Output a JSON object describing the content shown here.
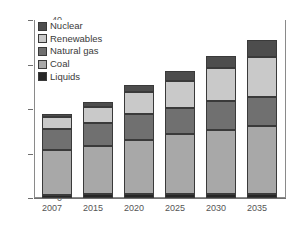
{
  "chart_data": {
    "type": "bar",
    "stacked": true,
    "title": "",
    "subtitle": "",
    "xlabel": "",
    "ylabel": "",
    "categories": [
      "2007",
      "2015",
      "2020",
      "2025",
      "2030",
      "2035"
    ],
    "series": [
      {
        "name": "Liquids",
        "color": "#262626",
        "values": [
          0.7,
          0.8,
          0.8,
          0.9,
          0.9,
          1.0
        ]
      },
      {
        "name": "Coal",
        "color": "#a8a8a8",
        "values": [
          10.2,
          11.0,
          12.2,
          13.4,
          14.4,
          15.1
        ]
      },
      {
        "name": "Natural gas",
        "color": "#707070",
        "values": [
          4.5,
          5.0,
          5.8,
          6.0,
          6.4,
          6.6
        ]
      },
      {
        "name": "Renewables",
        "color": "#c9c9c9",
        "values": [
          2.9,
          3.6,
          5.0,
          6.1,
          7.5,
          9.0
        ]
      },
      {
        "name": "Nuclear",
        "color": "#4d4d4d",
        "values": [
          0.5,
          1.1,
          1.7,
          2.1,
          2.8,
          3.8
        ]
      }
    ],
    "totals": [
      18.8,
      21.5,
      25.5,
      28.5,
      32.0,
      35.5
    ],
    "ylim": [
      0,
      40
    ],
    "yticks": [
      0,
      10,
      20,
      30,
      40
    ],
    "ytick_labels": [
      "0",
      "10",
      "20",
      "30",
      "40"
    ],
    "grid": true,
    "grid_axis": "y",
    "legend_position": "upper-left-inside",
    "legend_order": [
      "Nuclear",
      "Renewables",
      "Natural gas",
      "Coal",
      "Liquids"
    ]
  },
  "legend": {
    "items": [
      {
        "label": "Nuclear",
        "color": "#4d4d4d"
      },
      {
        "label": "Renewables",
        "color": "#c9c9c9"
      },
      {
        "label": "Natural gas",
        "color": "#707070"
      },
      {
        "label": "Coal",
        "color": "#a8a8a8"
      },
      {
        "label": "Liquids",
        "color": "#262626"
      }
    ]
  },
  "axes": {
    "y_ticks": [
      "40",
      "30",
      "20",
      "10",
      "0"
    ],
    "x_ticks": [
      "2007",
      "2015",
      "2020",
      "2025",
      "2030",
      "2035"
    ]
  },
  "colors": {
    "axis": "#6f6f6f",
    "grid": "#c8c8c8",
    "text": "#555555",
    "bar_outline": "#3a3a3a",
    "background": "#ffffff"
  }
}
